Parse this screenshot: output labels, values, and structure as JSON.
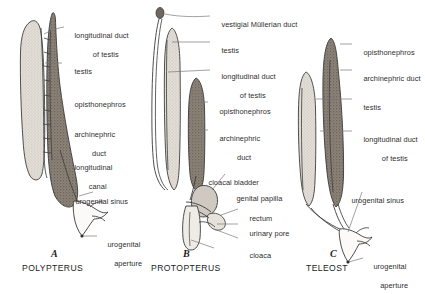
{
  "figure": {
    "background_color": "#ffffff",
    "ink_color": "#2b2b2b",
    "colors": {
      "testis_fill": "#ded9d2",
      "kidney_fill": "#8c8278",
      "duct_fill": "#f4f2ef",
      "outline": "#3a3a3a",
      "leader_line": "#6d6d6d"
    }
  },
  "panels": [
    {
      "letter": "A",
      "name": "POLYPTERUS",
      "labels": [
        {
          "id": "a-longitudinal-duct-of-testis",
          "line1": "longitudinal duct",
          "line2": "of testis"
        },
        {
          "id": "a-testis",
          "line1": "testis",
          "line2": ""
        },
        {
          "id": "a-opisthonephros",
          "line1": "opisthonephros",
          "line2": ""
        },
        {
          "id": "a-archinephric-duct",
          "line1": "archinephric",
          "line2": "duct"
        },
        {
          "id": "a-longitudinal-canal",
          "line1": "longitudinal",
          "line2": "canal"
        },
        {
          "id": "a-urogenital-sinus",
          "line1": "urogenital sinus",
          "line2": ""
        },
        {
          "id": "a-urogenital-aperture",
          "line1": "urogenital",
          "line2": "aperture"
        }
      ]
    },
    {
      "letter": "B",
      "name": "PROTOPTERUS",
      "labels": [
        {
          "id": "b-vestigial-mullerian-duct",
          "line1": "vestigial Müllerian duct",
          "line2": ""
        },
        {
          "id": "b-testis",
          "line1": "testis",
          "line2": ""
        },
        {
          "id": "b-longitudinal-duct-of-testis",
          "line1": "longitudinal duct",
          "line2": "of testis"
        },
        {
          "id": "b-opisthonephros",
          "line1": "opisthonephros",
          "line2": ""
        },
        {
          "id": "b-archinephric-duct",
          "line1": "archinephric",
          "line2": "duct"
        },
        {
          "id": "b-cloacal-bladder",
          "line1": "cloacal bladder",
          "line2": ""
        },
        {
          "id": "b-genital-papilla",
          "line1": "genital papilla",
          "line2": ""
        },
        {
          "id": "b-rectum",
          "line1": "rectum",
          "line2": ""
        },
        {
          "id": "b-urinary-pore",
          "line1": "urinary pore",
          "line2": ""
        },
        {
          "id": "b-cloaca",
          "line1": "cloaca",
          "line2": ""
        }
      ]
    },
    {
      "letter": "C",
      "name": "TELEOST",
      "labels": [
        {
          "id": "c-opisthonephros",
          "line1": "opisthonephros",
          "line2": ""
        },
        {
          "id": "c-archinephric-duct",
          "line1": "archinephric duct",
          "line2": ""
        },
        {
          "id": "c-testis",
          "line1": "testis",
          "line2": ""
        },
        {
          "id": "c-longitudinal-duct-of-testis",
          "line1": "longitudinal duct",
          "line2": "of testis"
        },
        {
          "id": "c-urogenital-sinus",
          "line1": "urogenital sinus",
          "line2": ""
        },
        {
          "id": "c-urogenital-aperture",
          "line1": "urogenital",
          "line2": "aperture"
        }
      ]
    }
  ]
}
